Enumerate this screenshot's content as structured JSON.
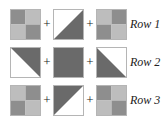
{
  "colors": {
    "dark": "#6a6a6a",
    "mid": "#8e8e8e",
    "light": "#bdbdbd",
    "white": "#ffffff"
  },
  "operator": "+",
  "rows": [
    {
      "label": "Row 1",
      "blocks": [
        {
          "type": "four-patch",
          "quadrants": [
            "mid",
            "light",
            "light",
            "mid"
          ]
        },
        {
          "type": "half-square",
          "dark_corner": "bottom-right",
          "description": "white top-left / dark bottom-right triangle"
        },
        {
          "type": "four-patch",
          "quadrants": [
            "light",
            "mid",
            "mid",
            "light"
          ]
        }
      ]
    },
    {
      "label": "Row 2",
      "blocks": [
        {
          "type": "half-square",
          "dark_corner": "top-right",
          "description": "dark top-right / white bottom-left triangle"
        },
        {
          "type": "solid",
          "fill": "dark"
        },
        {
          "type": "half-square",
          "dark_corner": "bottom-left",
          "description": "dark bottom-left / white top-right triangle"
        }
      ]
    },
    {
      "label": "Row 3",
      "blocks": [
        {
          "type": "four-patch",
          "quadrants": [
            "light",
            "mid",
            "mid",
            "light"
          ]
        },
        {
          "type": "half-square",
          "dark_corner": "top-left",
          "description": "dark top-left / white bottom-right triangle"
        },
        {
          "type": "four-patch",
          "quadrants": [
            "mid",
            "light",
            "light",
            "mid"
          ]
        }
      ]
    }
  ]
}
